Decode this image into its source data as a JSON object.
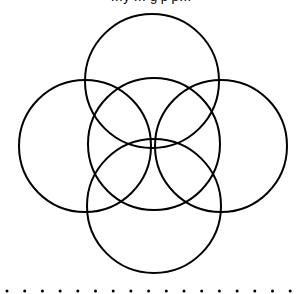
{
  "caption": "…y … g p p…",
  "diagram": {
    "stroke_color": "#000000",
    "stroke_width": 2,
    "circles": [
      {
        "name": "top",
        "cx": 152,
        "cy": 81,
        "r": 67
      },
      {
        "name": "left",
        "cx": 85,
        "cy": 146,
        "r": 66
      },
      {
        "name": "center",
        "cx": 154,
        "cy": 144,
        "r": 66
      },
      {
        "name": "right",
        "cx": 221,
        "cy": 146,
        "r": 66
      },
      {
        "name": "bottom",
        "cx": 154,
        "cy": 206,
        "r": 67
      }
    ],
    "dots": {
      "count": 17,
      "y": 291,
      "start_x": 7,
      "spacing": 17.7,
      "r": 1.5
    }
  }
}
